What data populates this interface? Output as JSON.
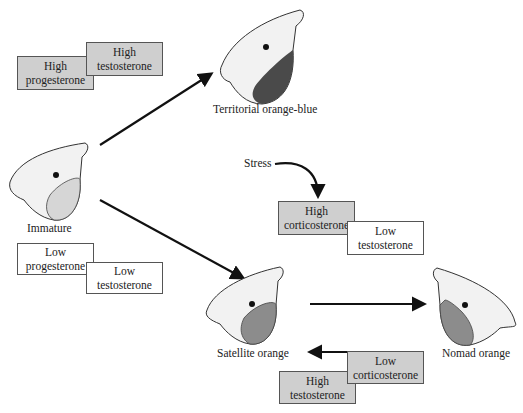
{
  "diagram": {
    "states": {
      "immature": "Immature",
      "territorial": "Territorial orange-blue",
      "satellite": "Satellite orange",
      "nomad": "Nomad orange"
    },
    "stress_label": "Stress",
    "hormone_boxes": {
      "territorial": [
        {
          "level": "High",
          "hormone": "progesterone",
          "shade": "high"
        },
        {
          "level": "High",
          "hormone": "testosterone",
          "shade": "high"
        }
      ],
      "satellite_path": [
        {
          "level": "Low",
          "hormone": "progesterone",
          "shade": "low"
        },
        {
          "level": "Low",
          "hormone": "testosterone",
          "shade": "low"
        }
      ],
      "to_nomad": [
        {
          "level": "High",
          "hormone": "corticosterone",
          "shade": "high"
        },
        {
          "level": "Low",
          "hormone": "testosterone",
          "shade": "low"
        }
      ],
      "to_satellite": [
        {
          "level": "High",
          "hormone": "testosterone",
          "shade": "high"
        },
        {
          "level": "Low",
          "hormone": "corticosterone",
          "shade": "high"
        }
      ]
    },
    "colors": {
      "high_box": "#cfcfcf",
      "low_box": "#ffffff",
      "throat_dark": "#5a5a5a",
      "throat_light": "#9a9a9a"
    }
  }
}
